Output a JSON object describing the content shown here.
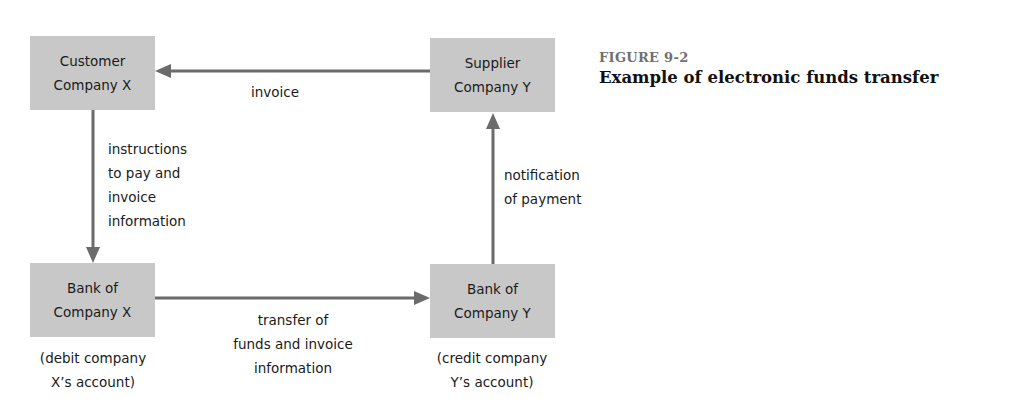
{
  "figure": {
    "number": "FIGURE 9-2",
    "title": "Example of electronic funds transfer"
  },
  "colors": {
    "node_fill": "#c8c8c8",
    "arrow": "#6b6b6b",
    "figure_number": "#707070",
    "text": "#1a1a1a"
  },
  "nodes": {
    "customer": {
      "lines": [
        "Customer",
        "Company X"
      ]
    },
    "supplier": {
      "lines": [
        "Supplier",
        "Company Y"
      ]
    },
    "bank_x": {
      "lines": [
        "Bank of",
        "Company X"
      ],
      "note": [
        "(debit company",
        "X’s account)"
      ]
    },
    "bank_y": {
      "lines": [
        "Bank of",
        "Company Y"
      ],
      "note": [
        "(credit company",
        "Y’s account)"
      ]
    }
  },
  "edges": [
    {
      "from": "supplier",
      "to": "customer",
      "label": [
        "invoice"
      ]
    },
    {
      "from": "customer",
      "to": "bank_x",
      "label": [
        "instructions",
        "to pay and",
        "invoice",
        "information"
      ]
    },
    {
      "from": "bank_x",
      "to": "bank_y",
      "label": [
        "transfer of",
        "funds and invoice",
        "information"
      ]
    },
    {
      "from": "bank_y",
      "to": "supplier",
      "label": [
        "notification",
        "of payment"
      ]
    }
  ]
}
